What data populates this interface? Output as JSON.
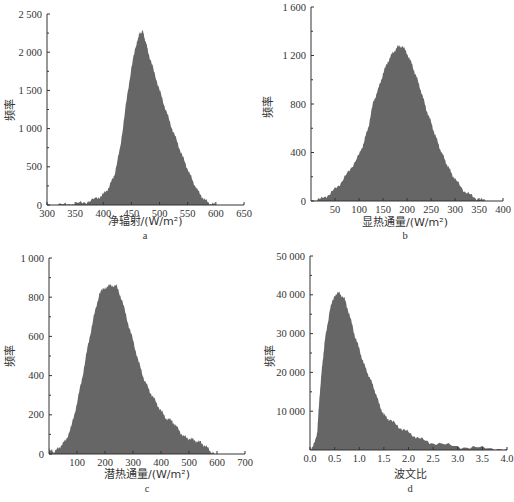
{
  "chart_data": [
    {
      "id": "a",
      "type": "area",
      "subtitle": "a",
      "xlabel": "净辐射/(W/m²)",
      "ylabel": "频率",
      "xlim": [
        300,
        650
      ],
      "ylim": [
        0,
        2500
      ],
      "xticks": [
        300,
        350,
        400,
        450,
        500,
        550,
        600,
        650
      ],
      "yticks": [
        0,
        500,
        1000,
        1500,
        2000,
        2500
      ],
      "ytick_labels": [
        "0",
        "500",
        "1 000",
        "1 500",
        "2 000",
        "2 500"
      ],
      "fill": "#666666",
      "x": [
        300,
        330,
        350,
        370,
        390,
        400,
        410,
        420,
        430,
        440,
        450,
        460,
        465,
        470,
        475,
        480,
        490,
        500,
        510,
        520,
        530,
        540,
        550,
        560,
        570,
        580,
        590,
        600
      ],
      "values": [
        0,
        5,
        15,
        40,
        90,
        140,
        230,
        400,
        750,
        1300,
        1800,
        2150,
        2250,
        2280,
        2150,
        2000,
        1750,
        1500,
        1270,
        1050,
        850,
        650,
        470,
        300,
        160,
        70,
        20,
        0
      ]
    },
    {
      "id": "b",
      "type": "area",
      "subtitle": "b",
      "xlabel": "显热通量/(W/m²)",
      "ylabel": "频率",
      "xlim": [
        0,
        400
      ],
      "ylim": [
        0,
        1600
      ],
      "xticks": [
        50,
        100,
        150,
        200,
        250,
        300,
        350,
        400
      ],
      "yticks": [
        0,
        400,
        800,
        1200,
        1600
      ],
      "ytick_labels": [
        "0",
        "400",
        "800",
        "1 200",
        "1 600"
      ],
      "fill": "#666666",
      "x": [
        0,
        20,
        40,
        60,
        80,
        100,
        110,
        120,
        130,
        140,
        150,
        160,
        170,
        180,
        190,
        200,
        210,
        220,
        230,
        240,
        250,
        260,
        270,
        280,
        290,
        300,
        320,
        340,
        360,
        370
      ],
      "values": [
        0,
        15,
        60,
        140,
        250,
        380,
        480,
        620,
        820,
        920,
        1050,
        1150,
        1220,
        1270,
        1280,
        1220,
        1130,
        1020,
        900,
        760,
        650,
        530,
        420,
        330,
        250,
        180,
        80,
        30,
        5,
        0
      ]
    },
    {
      "id": "c",
      "type": "area",
      "subtitle": "c",
      "xlabel": "潜热通量/(W/m²)",
      "ylabel": "频率",
      "xlim": [
        0,
        700
      ],
      "ylim": [
        0,
        1000
      ],
      "xticks": [
        100,
        200,
        300,
        400,
        500,
        600,
        700
      ],
      "yticks": [
        0,
        200,
        400,
        600,
        800,
        1000
      ],
      "ytick_labels": [
        "0",
        "200",
        "400",
        "600",
        "800",
        "1 000"
      ],
      "fill": "#666666",
      "x": [
        0,
        10,
        20,
        40,
        60,
        80,
        100,
        120,
        140,
        160,
        180,
        200,
        220,
        240,
        260,
        280,
        300,
        320,
        340,
        360,
        380,
        400,
        420,
        440,
        460,
        480,
        500,
        520,
        540,
        560,
        580,
        590
      ],
      "values": [
        30,
        15,
        10,
        40,
        70,
        140,
        260,
        400,
        560,
        700,
        820,
        850,
        860,
        860,
        790,
        680,
        580,
        470,
        380,
        320,
        270,
        220,
        180,
        170,
        130,
        90,
        80,
        70,
        60,
        40,
        10,
        0
      ]
    },
    {
      "id": "d",
      "type": "area",
      "subtitle": "d",
      "xlabel": "波文比",
      "ylabel": "频率",
      "xlim": [
        0,
        4.0
      ],
      "ylim": [
        0,
        50000
      ],
      "xticks": [
        0.0,
        0.5,
        1.0,
        1.5,
        2.0,
        2.5,
        3.0,
        3.5,
        4.0
      ],
      "xtick_labels": [
        "0.0",
        "0.5",
        "1.0",
        "1.5",
        "2.0",
        "2.5",
        "3.0",
        "3.5",
        "4.0"
      ],
      "yticks": [
        10000,
        20000,
        30000,
        40000,
        50000
      ],
      "ytick_labels": [
        "10 000",
        "20 000",
        "30 000",
        "40 000",
        "50 000"
      ],
      "fill": "#666666",
      "x": [
        0.0,
        0.1,
        0.15,
        0.2,
        0.25,
        0.3,
        0.4,
        0.5,
        0.6,
        0.7,
        0.8,
        0.9,
        1.0,
        1.1,
        1.2,
        1.3,
        1.4,
        1.5,
        1.6,
        1.8,
        2.0,
        2.2,
        2.5,
        3.0,
        3.5,
        4.0
      ],
      "values": [
        0,
        2000,
        5000,
        15000,
        22000,
        28000,
        36000,
        40000,
        40500,
        39000,
        35000,
        30000,
        26000,
        22000,
        19000,
        16000,
        12000,
        9000,
        8000,
        6000,
        4500,
        3000,
        1800,
        900,
        500,
        300
      ]
    }
  ],
  "panels": {
    "a": {
      "subtitle": "a",
      "xlabel": "净辐射/(W/m²)",
      "ylabel": "频率"
    },
    "b": {
      "subtitle": "b",
      "xlabel": "显热通量/(W/m²)",
      "ylabel": "频率"
    },
    "c": {
      "subtitle": "c",
      "xlabel": "潜热通量/(W/m²)",
      "ylabel": "频率"
    },
    "d": {
      "subtitle": "d",
      "xlabel": "波文比",
      "ylabel": "频率"
    }
  }
}
